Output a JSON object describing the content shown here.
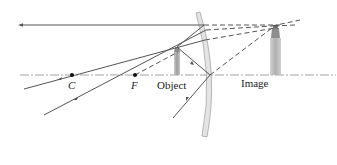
{
  "diagram": {
    "type": "ray-diagram",
    "labels": {
      "center_of_curvature": "C",
      "focal_point": "F",
      "object": "Object",
      "image": "Image"
    },
    "colors": {
      "ray": "#555555",
      "axis": "#8a8a8a",
      "mirror_fill": "#e2e2e2",
      "mirror_edge": "#9a9a9a",
      "object_fill": "#a9a9a9",
      "image_fill": "#b9b9b9",
      "point": "#111111"
    },
    "elements": {
      "optical_axis": "dash-dot horizontal line",
      "mirror": "convex spherical mirror",
      "rays": [
        "parallel ray reflected back as if from image top",
        "ray toward F reflected parallel",
        "ray toward C reflected back along itself",
        "ray to mirror vertex reflected symmetric"
      ]
    }
  }
}
